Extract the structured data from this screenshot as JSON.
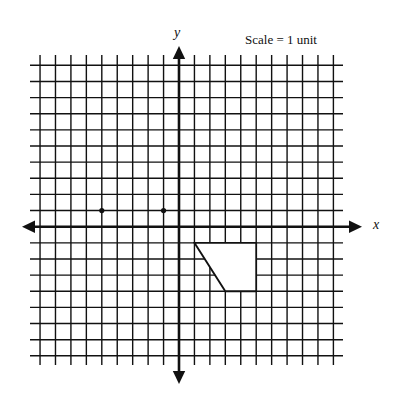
{
  "figure": {
    "type": "coordinate-grid",
    "scale_label": "Scale = 1 unit",
    "x_axis_label": "x",
    "y_axis_label": "y",
    "colors": {
      "background": "#ffffff",
      "ink": "#111111",
      "shape_fill": "#ffffff"
    }
  },
  "grid": {
    "x_min": -9,
    "x_max": 10,
    "y_min": -8,
    "y_max": 10,
    "step": 1
  },
  "points": [
    {
      "label": "point-1",
      "x": -5,
      "y": 1
    },
    {
      "label": "point-2",
      "x": -1,
      "y": 1
    }
  ],
  "shape": {
    "label": "quadrilateral",
    "vertices": [
      {
        "x": 1,
        "y": -1
      },
      {
        "x": 5,
        "y": -1
      },
      {
        "x": 5,
        "y": -4
      },
      {
        "x": 3,
        "y": -4
      }
    ]
  },
  "chart_data": {
    "type": "scatter",
    "title": "",
    "xlabel": "x",
    "ylabel": "y",
    "annotation": "Scale = 1 unit",
    "xlim": [
      -9,
      10
    ],
    "ylim": [
      -8,
      10
    ],
    "grid": true,
    "series": [
      {
        "name": "points",
        "x": [
          -5,
          -1
        ],
        "y": [
          1,
          1
        ]
      },
      {
        "name": "quadrilateral",
        "x": [
          1,
          5,
          5,
          3,
          1
        ],
        "y": [
          -1,
          -1,
          -4,
          -4,
          -1
        ]
      }
    ]
  }
}
